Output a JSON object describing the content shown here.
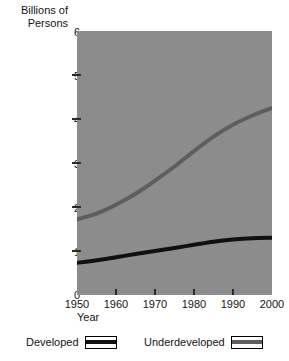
{
  "chart_data": {
    "type": "line",
    "title": "",
    "ylabel_line1": "Billions of",
    "ylabel_line2": "Persons",
    "xlabel": "Year",
    "xlim": [
      1950,
      2000
    ],
    "ylim": [
      0,
      6
    ],
    "xticks": [
      1950,
      1960,
      1970,
      1980,
      1990,
      2000
    ],
    "xtick_labels": [
      "1950",
      "1960",
      "1970",
      "1980",
      "1990",
      "2000"
    ],
    "yticks": [
      0,
      1,
      2,
      3,
      4,
      5,
      6
    ],
    "ytick_labels": [
      "0",
      "1",
      "2",
      "3",
      "4",
      "5",
      "6"
    ],
    "grid": false,
    "legend_position": "below",
    "plot_background": "#8c8c8c",
    "x": [
      1950,
      1955,
      1960,
      1965,
      1970,
      1975,
      1980,
      1985,
      1990,
      1995,
      2000
    ],
    "series": [
      {
        "name": "Developed",
        "color": "#101010",
        "values": [
          0.73,
          0.79,
          0.86,
          0.93,
          1.0,
          1.07,
          1.14,
          1.21,
          1.26,
          1.29,
          1.3
        ]
      },
      {
        "name": "Underdeveloped",
        "color": "#5e5e5e",
        "values": [
          1.72,
          1.85,
          2.05,
          2.3,
          2.6,
          2.92,
          3.27,
          3.6,
          3.87,
          4.08,
          4.25
        ]
      }
    ],
    "legend": [
      {
        "label": "Developed",
        "color": "#101010"
      },
      {
        "label": "Underdeveloped",
        "color": "#5e5e5e"
      }
    ]
  }
}
